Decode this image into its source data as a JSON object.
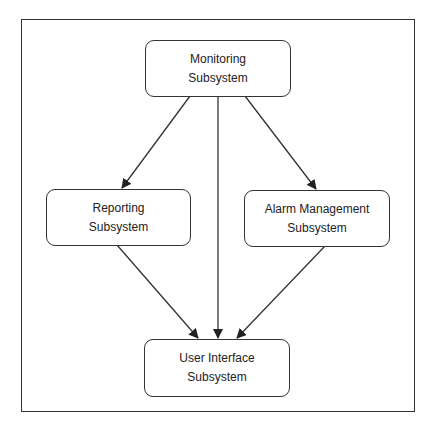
{
  "diagram": {
    "type": "block-diagram",
    "colors": {
      "stroke": "#333333",
      "background": "#ffffff",
      "text": "#222222"
    },
    "nodes": [
      {
        "id": "monitoring",
        "line1": "Monitoring",
        "line2": "Subsystem"
      },
      {
        "id": "reporting",
        "line1": "Reporting",
        "line2": "Subsystem"
      },
      {
        "id": "alarm",
        "line1": "Alarm Management",
        "line2": "Subsystem"
      },
      {
        "id": "ui",
        "line1": "User Interface",
        "line2": "Subsystem"
      }
    ],
    "edges": [
      {
        "from": "monitoring",
        "to": "reporting"
      },
      {
        "from": "monitoring",
        "to": "ui"
      },
      {
        "from": "monitoring",
        "to": "alarm"
      },
      {
        "from": "reporting",
        "to": "ui"
      },
      {
        "from": "alarm",
        "to": "ui"
      }
    ]
  }
}
